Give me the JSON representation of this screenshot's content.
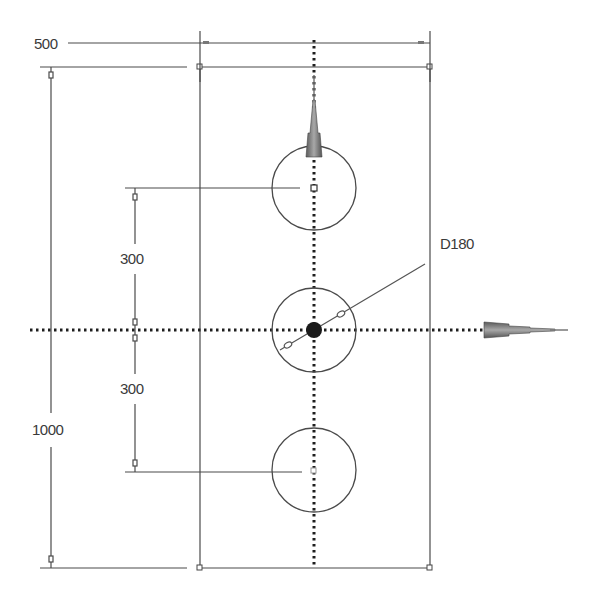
{
  "diagram": {
    "type": "cad-sketch",
    "plate": {
      "width_label": "500",
      "height_label": "1000"
    },
    "holes": {
      "count": 3,
      "diameter_label": "D180",
      "spacing_labels": [
        "300",
        "300"
      ]
    },
    "colors": {
      "line": "#4a4a4a",
      "centerline": "#222222",
      "axis_glyph": "#6e6e6e",
      "background": "#ffffff"
    },
    "icons": [
      "y-axis-arrow-icon",
      "x-axis-arrow-icon",
      "origin-point-icon"
    ]
  }
}
